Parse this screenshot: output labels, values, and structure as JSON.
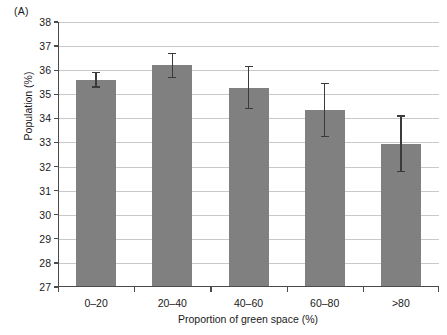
{
  "panel": {
    "label": "(A)"
  },
  "chart_data": {
    "type": "bar",
    "title": "",
    "subtitle": "",
    "panel_label": "(A)",
    "xlabel": "Proportion of green space (%)",
    "ylabel": "Population (%)",
    "categories": [
      "0–20",
      "20–40",
      "40–60",
      "60–80",
      ">80"
    ],
    "values": [
      35.6,
      36.2,
      35.25,
      34.35,
      32.95
    ],
    "error_upper": [
      35.9,
      36.7,
      36.15,
      35.45,
      34.1
    ],
    "error_lower": [
      35.3,
      35.7,
      34.4,
      33.25,
      31.8
    ],
    "ylim": [
      27,
      38
    ],
    "ytick_labels": [
      "27",
      "28",
      "29",
      "30",
      "31",
      "32",
      "33",
      "34",
      "35",
      "36",
      "37",
      "38"
    ],
    "ytick_values": [
      27,
      28,
      29,
      30,
      31,
      32,
      33,
      34,
      35,
      36,
      37,
      38
    ],
    "grid": true,
    "grid_axis": "y",
    "legend": false,
    "legend_position": "none",
    "bar_color": "#808080",
    "error_color": "#3a3a3a",
    "grid_color": "#c9c9c9",
    "axis_color": "#4a4a4a",
    "background": "#ffffff"
  }
}
